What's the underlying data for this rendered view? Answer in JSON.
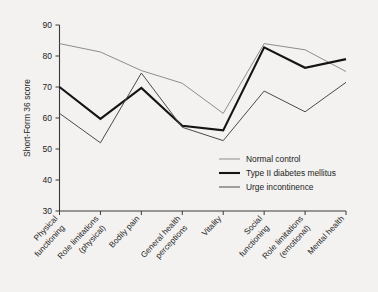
{
  "chart_data": {
    "type": "line",
    "title": "",
    "xlabel": "",
    "ylabel": "Short-Form 36 score",
    "ylim": [
      30,
      90
    ],
    "yticks": [
      30,
      40,
      50,
      60,
      70,
      80,
      90
    ],
    "grid": false,
    "legend_position": "center-right",
    "categories": [
      "Physical functioning",
      "Role limitations (physical)",
      "Bodily pain",
      "General health perceptions",
      "Vitality",
      "Social functioning",
      "Role limitations (emotional)",
      "Mental health"
    ],
    "category_lines": [
      [
        "Physical",
        "functioning"
      ],
      [
        "Role limitations",
        "(physical)"
      ],
      [
        "Bodily pain"
      ],
      [
        "General health",
        "perceptions"
      ],
      [
        "Vitality"
      ],
      [
        "Social",
        "functioning"
      ],
      [
        "Role limitations",
        "(emotional)"
      ],
      [
        "Mental health"
      ]
    ],
    "series": [
      {
        "name": "Normal control",
        "color": "#8d8d8d",
        "width": 1.0,
        "values": [
          84.0,
          81.3,
          75.3,
          71.2,
          61.5,
          84.0,
          82.0,
          75.0
        ]
      },
      {
        "name": "Type II diabetes mellitus",
        "color": "#141414",
        "width": 2.1,
        "values": [
          70.0,
          59.7,
          69.7,
          57.5,
          56.0,
          82.8,
          76.2,
          79.0
        ]
      },
      {
        "name": "Urge incontinence",
        "color": "#4a4a4a",
        "width": 1.0,
        "values": [
          61.5,
          52.0,
          74.5,
          57.0,
          52.7,
          68.7,
          62.0,
          71.5
        ]
      }
    ]
  },
  "legend": {
    "items": [
      {
        "label": "Normal control"
      },
      {
        "label": "Type II diabetes mellitus"
      },
      {
        "label": "Urge incontinence"
      }
    ]
  },
  "axis": {
    "y_title": "Short-Form 36 score"
  }
}
